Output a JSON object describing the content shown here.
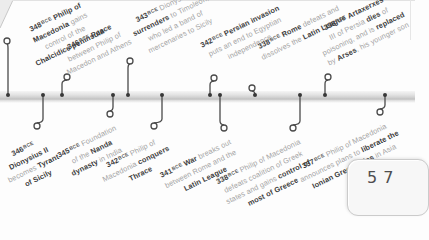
{
  "page": {
    "number": "57"
  },
  "timeline": {
    "ink_dark": "#3d3d3d",
    "ink_light": "#a4a4a4",
    "band_color_top": "#f4f4f4",
    "band_color_bottom": "#bdbdbd",
    "events": [
      {
        "date": "348",
        "era": "BCE",
        "side": "top",
        "dot_x": 8,
        "ring_x": 7,
        "ring_y": 41,
        "label": {
          "x": 13,
          "y": 31,
          "w": 88
        },
        "lines": [
          [
            {
              "t": "Philip of",
              "s": "b"
            }
          ],
          [
            {
              "t": "Macedonia",
              "s": "b"
            },
            {
              "t": " gains",
              "s": "l"
            }
          ],
          [
            {
              "t": "control of the",
              "s": "l"
            }
          ],
          [
            {
              "t": "Chalcidice peninsula",
              "s": "b"
            }
          ]
        ]
      },
      {
        "date": "346",
        "era": "BCE",
        "side": "bottom",
        "dot_x": 43,
        "ring_x": 37,
        "ring_y": 126,
        "label": {
          "x": 47,
          "y": 130,
          "w": 58
        },
        "lines": [
          [],
          [
            {
              "t": "Dionysius II",
              "s": "b"
            }
          ],
          [
            {
              "t": "becomes ",
              "s": "l"
            },
            {
              "t": "Tyrant",
              "s": "b"
            }
          ],
          [
            {
              "t": "of Sicily",
              "s": "b"
            }
          ]
        ]
      },
      {
        "date": "346",
        "era": "BCE",
        "side": "top",
        "dot_x": 62,
        "ring_x": 67,
        "ring_y": 77,
        "label": {
          "x": 48,
          "y": 50,
          "w": 86
        },
        "lines": [
          [
            {
              "t": "Peace",
              "s": "b"
            }
          ],
          [
            {
              "t": "between Philip of",
              "s": "l"
            }
          ],
          [
            {
              "t": "Macedon and Athens",
              "s": "l"
            }
          ]
        ]
      },
      {
        "date": "345",
        "era": "BCE",
        "side": "bottom",
        "dot_x": 113,
        "ring_x": 110,
        "ring_y": 114,
        "label": {
          "x": 121,
          "y": 118,
          "w": 82
        },
        "lines": [
          [
            {
              "t": "Foundation",
              "s": "l"
            }
          ],
          [
            {
              "t": "of the ",
              "s": "l"
            },
            {
              "t": "Nanda",
              "s": "b"
            }
          ],
          [
            {
              "t": "dynasty",
              "s": "b"
            },
            {
              "t": " in India",
              "s": "l"
            }
          ]
        ]
      },
      {
        "date": "343",
        "era": "BCE",
        "side": "top",
        "dot_x": 128,
        "ring_x": 130,
        "ring_y": 61,
        "label": {
          "x": 118,
          "y": 22,
          "w": 100
        },
        "lines": [
          [
            {
              "t": "Dionysius II",
              "s": "l"
            }
          ],
          [
            {
              "t": "surrenders",
              "s": "b"
            },
            {
              "t": " to Timoleon,",
              "s": "l"
            }
          ],
          [
            {
              "t": "who led a band of",
              "s": "l"
            }
          ],
          [
            {
              "t": "mercenaries to Sicily",
              "s": "l"
            }
          ]
        ]
      },
      {
        "date": "342",
        "era": "BCE",
        "side": "bottom",
        "dot_x": 162,
        "ring_x": 154,
        "ring_y": 126,
        "label": {
          "x": 165,
          "y": 130,
          "w": 82
        },
        "lines": [
          [
            {
              "t": "Philip of",
              "s": "l"
            }
          ],
          [
            {
              "t": "Macedonia ",
              "s": "l"
            },
            {
              "t": "conquers",
              "s": "b"
            }
          ],
          [
            {
              "t": "Thrace",
              "s": "b"
            }
          ]
        ]
      },
      {
        "date": "342",
        "era": "BCE",
        "side": "top",
        "dot_x": 210,
        "ring_x": 214,
        "ring_y": 78,
        "label": {
          "x": 194,
          "y": 42,
          "w": 96
        },
        "lines": [
          [
            {
              "t": "Persian invasion",
              "s": "b"
            }
          ],
          [
            {
              "t": "puts an end to Egyptian",
              "s": "l"
            }
          ],
          [
            {
              "t": "independence",
              "s": "l"
            }
          ]
        ]
      },
      {
        "date": "341",
        "era": "BCE",
        "side": "bottom",
        "dot_x": 220,
        "ring_x": 224,
        "ring_y": 128,
        "label": {
          "x": 236,
          "y": 132,
          "w": 96
        },
        "lines": [
          [
            {
              "t": "War",
              "s": "b"
            },
            {
              "t": " breaks out",
              "s": "l"
            }
          ],
          [
            {
              "t": "between Rome and the",
              "s": "l"
            }
          ],
          [
            {
              "t": "Latin League",
              "s": "b"
            }
          ]
        ]
      },
      {
        "date": "338",
        "era": "BCE",
        "side": "top",
        "dot_x": 255,
        "ring_x": 252,
        "ring_y": 88,
        "label": {
          "x": 250,
          "y": 44,
          "w": 102
        },
        "lines": [
          [
            {
              "t": "Rome",
              "s": "b"
            },
            {
              "t": " defeats and",
              "s": "l"
            }
          ],
          [
            {
              "t": "dissolves the ",
              "s": "l"
            },
            {
              "t": "Latin League",
              "s": "b"
            }
          ]
        ]
      },
      {
        "date": "338",
        "era": "BCE",
        "side": "bottom",
        "dot_x": 300,
        "ring_x": 293,
        "ring_y": 128,
        "label": {
          "x": 305,
          "y": 132,
          "w": 110
        },
        "lines": [
          [
            {
              "t": "Philip of Macedonia",
              "s": "l"
            }
          ],
          [
            {
              "t": "defeats coalition of Greek",
              "s": "l"
            }
          ],
          [
            {
              "t": "states and gains ",
              "s": "l"
            },
            {
              "t": "control of",
              "s": "b"
            }
          ],
          [
            {
              "t": "most of Greece",
              "s": "b"
            }
          ]
        ]
      },
      {
        "date": "338",
        "era": "BCE",
        "side": "top",
        "dot_x": 325,
        "ring_x": 328,
        "ring_y": 77,
        "label": {
          "x": 306,
          "y": 30,
          "w": 100
        },
        "lines": [
          [
            {
              "t": "Artaxerxes",
              "s": "b"
            }
          ],
          [
            {
              "t": "III of Persia ",
              "s": "l"
            },
            {
              "t": "dies",
              "s": "b"
            },
            {
              "t": " of",
              "s": "l"
            }
          ],
          [
            {
              "t": "poisoning, and is ",
              "s": "l"
            },
            {
              "t": "replaced",
              "s": "b"
            }
          ],
          [
            {
              "t": "by ",
              "s": "l"
            },
            {
              "t": "Arses",
              "s": "b"
            },
            {
              "t": ", his younger son",
              "s": "l"
            }
          ]
        ]
      },
      {
        "date": "337",
        "era": "BCE",
        "side": "bottom",
        "dot_x": 385,
        "ring_x": 380,
        "ring_y": 112,
        "label": {
          "x": 392,
          "y": 116,
          "w": 112
        },
        "lines": [
          [
            {
              "t": "Philip of Macedonia",
              "s": "l"
            }
          ],
          [
            {
              "t": "announces plans to ",
              "s": "l"
            },
            {
              "t": "liberate the",
              "s": "b"
            }
          ],
          [
            {
              "t": "Ionian Greek cities",
              "s": "b"
            },
            {
              "t": " in Asia Minor",
              "s": "l"
            }
          ]
        ]
      }
    ]
  }
}
